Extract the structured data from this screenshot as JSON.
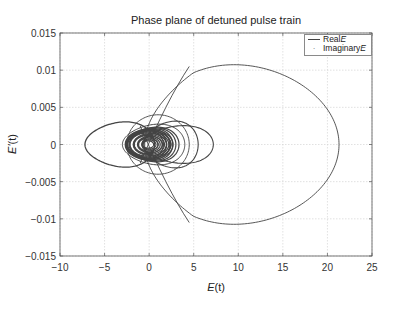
{
  "chart_data": {
    "type": "line",
    "title": "Phase plane of detuned pulse train",
    "xlabel": "E(t)",
    "ylabel": "E'(t)",
    "xlim": [
      -10,
      25
    ],
    "ylim": [
      -0.015,
      0.015
    ],
    "grid": true,
    "legend_position": "upper right",
    "x_ticks": [
      -10,
      -5,
      0,
      5,
      10,
      15,
      20,
      25
    ],
    "x_tick_labels": [
      "−10",
      "−5",
      "0",
      "5",
      "10",
      "15",
      "20",
      "25"
    ],
    "y_ticks": [
      0.015,
      0.01,
      0.005,
      0,
      -0.005,
      -0.01,
      -0.015
    ],
    "y_tick_labels": [
      "0.015",
      "0.01",
      "0.005",
      "0",
      "−0.005",
      "−0.01",
      "−0.015"
    ],
    "series": [
      {
        "name": "Real E",
        "style": "solid line",
        "color": "#444444",
        "loops": [
          {
            "description": "large right loop",
            "x_min": -0.5,
            "x_max": 21.3,
            "y_max": 0.0107,
            "y_min": -0.0107,
            "center_x": 11.2
          },
          {
            "description": "left lobe",
            "x_min": -7.2,
            "x_max": 0.5,
            "y_max": 0.003,
            "y_min": -0.003
          },
          {
            "description": "right lobe large",
            "x_min": -0.5,
            "x_max": 7.2,
            "y_max": 0.0025,
            "y_min": -0.0025
          },
          {
            "description": "right lobe medium",
            "x_min": -0.5,
            "x_max": 5.5,
            "y_max": 0.0032,
            "y_min": -0.0032
          },
          {
            "description": "middle loop",
            "x_min": -2.5,
            "x_max": 4.5,
            "y_max": 0.004,
            "y_min": -0.004
          },
          {
            "description": "dense core rings",
            "x_min": -2.5,
            "x_max": 2.5,
            "y_max": 0.0022,
            "y_min": -0.0022
          }
        ]
      },
      {
        "name": "Imaginary E",
        "style": "dot markers",
        "color": "#777777",
        "loops": []
      }
    ]
  },
  "legend": {
    "items": [
      {
        "label": "Real ",
        "symbol": "E"
      },
      {
        "label": "Imaginary ",
        "symbol": "E"
      }
    ]
  },
  "labels": {
    "title": "Phase plane of detuned pulse train",
    "xlabel_main": "E",
    "xlabel_rest": "(t)",
    "ylabel_main": "E'",
    "ylabel_rest": "(t)"
  }
}
